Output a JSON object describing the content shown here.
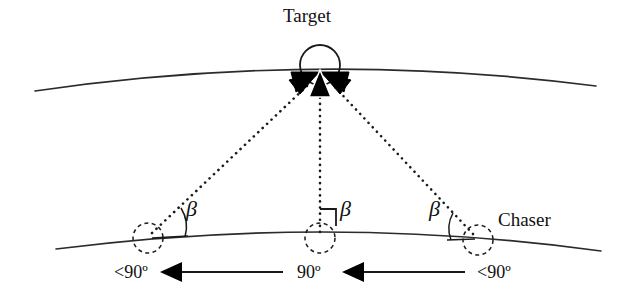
{
  "figure": {
    "type": "geometry-diagram",
    "labels": {
      "target": "Target",
      "chaser": "Chaser",
      "beta_left": "β",
      "beta_middle": "β",
      "beta_right": "β",
      "angle_left": "<90º",
      "angle_middle": "90º",
      "angle_right": "<90º"
    },
    "colors": {
      "ink": "#111111",
      "stroke": "#2b2b2b",
      "background": "#ffffff",
      "fill_arrowhead": "#000000"
    },
    "geometry": {
      "target_point": {
        "x": 320,
        "y": 74
      },
      "target_circle": {
        "cx": 320,
        "cy": 65,
        "r": 20
      },
      "upper_arc": {
        "from": [
          35,
          91
        ],
        "to": [
          596,
          86
        ],
        "apex_y": 68
      },
      "lower_arc": {
        "from": [
          56,
          249
        ],
        "to": [
          601,
          251
        ],
        "apex_y": 231
      },
      "chaser_positions": [
        {
          "name": "left",
          "cx": 148,
          "cy": 238,
          "r": 15,
          "angle_marker": "arc"
        },
        {
          "name": "middle",
          "cx": 320,
          "cy": 238,
          "r": 15,
          "angle_marker": "right-angle-square"
        },
        {
          "name": "right",
          "cx": 478,
          "cy": 240,
          "r": 15,
          "angle_marker": "arc"
        }
      ],
      "sight_lines": [
        {
          "from": [
            148,
            238
          ],
          "to": [
            320,
            74
          ],
          "style": "dotted"
        },
        {
          "from": [
            320,
            238
          ],
          "to": [
            320,
            74
          ],
          "style": "dotted"
        },
        {
          "from": [
            478,
            240
          ],
          "to": [
            320,
            74
          ],
          "style": "dotted"
        }
      ],
      "velocity_arrows": [
        {
          "direction": "left",
          "tail": [
            280,
            272
          ],
          "head": [
            165,
            272
          ]
        },
        {
          "direction": "left",
          "tail": [
            462,
            272
          ],
          "head": [
            347,
            272
          ]
        }
      ]
    }
  }
}
